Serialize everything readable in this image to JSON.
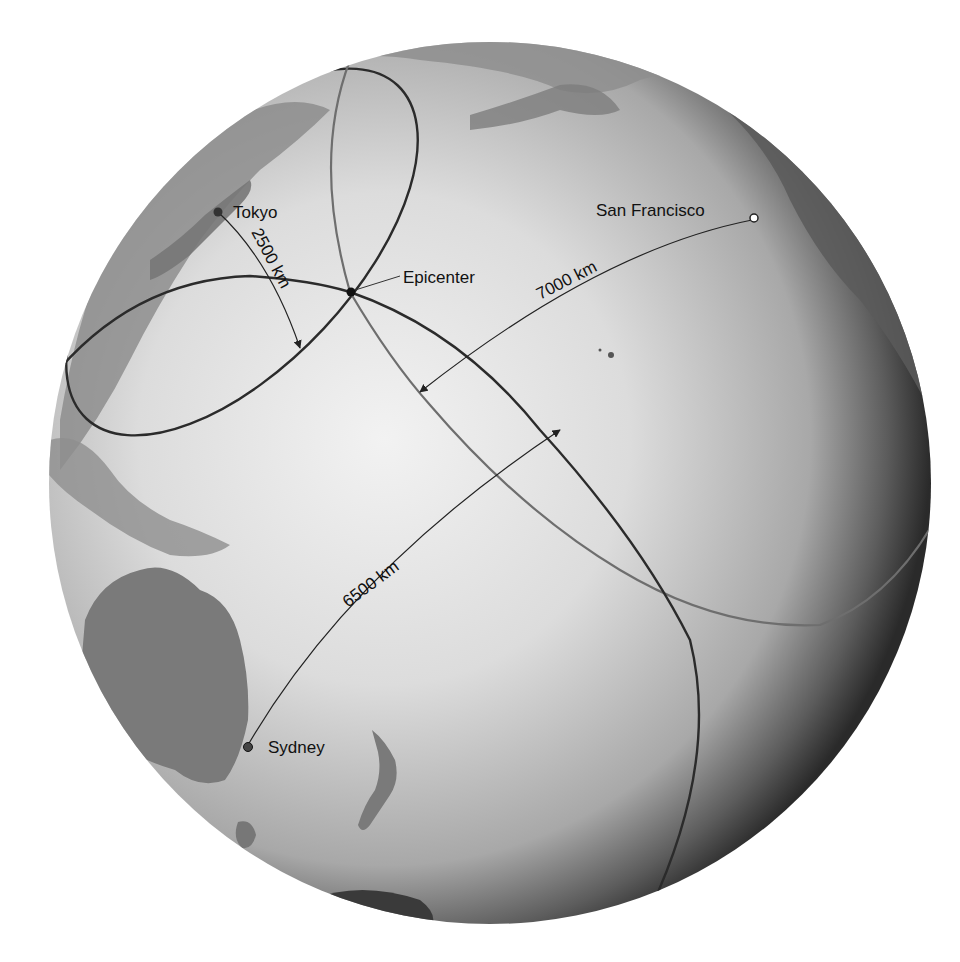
{
  "figure": {
    "type": "earthquake epicenter triangulation diagram on globe",
    "colors": {
      "background": "#ffffff",
      "ocean_light": "#ebebeb",
      "ocean_dark": "#3a3a3a",
      "land": "#8a8a8a",
      "circle_dark": "#2b2b2b",
      "circle_light": "#6e6e6e",
      "text": "#111111"
    }
  },
  "stations": [
    {
      "name": "Tokyo",
      "distance_label": "2500 km",
      "marker": "filled-dot"
    },
    {
      "name": "San Francisco",
      "distance_label": "7000 km",
      "marker": "open-dot"
    },
    {
      "name": "Sydney",
      "distance_label": "6500 km",
      "marker": "filled-dot"
    }
  ],
  "epicenter": {
    "label": "Epicenter"
  },
  "labels": {
    "tokyo": "Tokyo",
    "san_francisco": "San Francisco",
    "sydney": "Sydney",
    "epicenter": "Epicenter",
    "tokyo_distance": "2500 km",
    "sf_distance": "7000 km",
    "sydney_distance": "6500 km"
  }
}
